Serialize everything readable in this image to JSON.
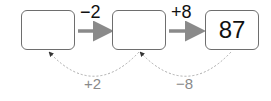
{
  "boxes": [
    {
      "value": ""
    },
    {
      "value": ""
    },
    {
      "value": "87"
    }
  ],
  "forward_ops": [
    "−2",
    "+8"
  ],
  "backward_ops": [
    "+2",
    "−8"
  ],
  "colors": {
    "arrow": "#8a8a8a",
    "box_border": "#6e6e6e",
    "dotted": "#b0b0b0"
  }
}
